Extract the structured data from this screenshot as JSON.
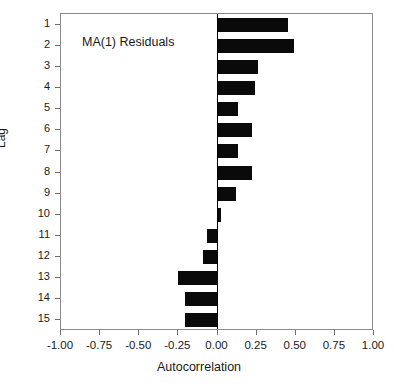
{
  "chart_data": {
    "type": "bar",
    "orientation": "horizontal",
    "title": "",
    "annotation": "MA(1) Residuals",
    "xlabel": "Autocorrelation",
    "ylabel": "Lag",
    "xlim": [
      -1.0,
      1.0
    ],
    "xticks": [
      -1.0,
      -0.75,
      -0.5,
      -0.25,
      0.0,
      0.25,
      0.5,
      0.75,
      1.0
    ],
    "xticklabels": [
      "-1.00",
      "-0.75",
      "-0.50",
      "-0.25",
      "0.00",
      "0.25",
      "0.50",
      "0.75",
      "1.00"
    ],
    "categories": [
      1,
      2,
      3,
      4,
      5,
      6,
      7,
      8,
      9,
      10,
      11,
      12,
      13,
      14,
      15
    ],
    "yticklabels": [
      "1",
      "2",
      "3",
      "4",
      "5",
      "6",
      "7",
      "8",
      "9",
      "10",
      "11",
      "12",
      "13",
      "14",
      "15"
    ],
    "values": [
      0.45,
      0.49,
      0.26,
      0.24,
      0.13,
      0.22,
      0.13,
      0.22,
      0.12,
      0.02,
      -0.07,
      -0.09,
      -0.25,
      -0.21,
      -0.21
    ],
    "grid": false,
    "legend": null,
    "bar_color": "#0a0a0a",
    "frame_color": "#8a8a8a"
  }
}
